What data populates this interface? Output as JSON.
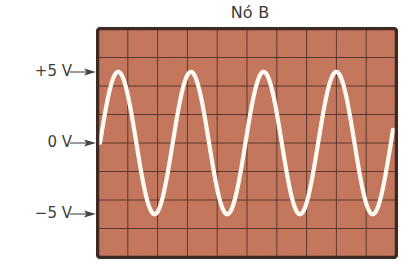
{
  "title": "Nó B",
  "labels": {
    "plus5": "+5 V",
    "zero": "0 V",
    "minus5": "−5 V"
  },
  "colors": {
    "screen": "#c8775c",
    "grid": "#4a2e27",
    "border": "#3e2a25",
    "trace": "#fffaf2",
    "text": "#3e3e3e"
  },
  "chart_data": {
    "type": "line",
    "title": "Nó B",
    "grid": {
      "columns": 10,
      "rows": 8,
      "on": true
    },
    "ylabel_ticks": [
      "+5 V",
      "0 V",
      "−5 V"
    ],
    "y_reference_levels_V": [
      5,
      0,
      -5
    ],
    "volts_per_division": 2,
    "series": [
      {
        "name": "Node B voltage",
        "waveform": "sine",
        "amplitude_V": 5,
        "peak_to_peak_V": 10,
        "offset_V": 0,
        "cycles_displayed": 4,
        "period_divisions": 2.44,
        "start_phase": "0 V rising"
      }
    ],
    "ylim": [
      -8,
      8
    ]
  }
}
